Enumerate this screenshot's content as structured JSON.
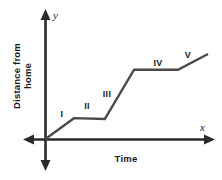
{
  "figure": {
    "background_color": "#ffffff",
    "line_color": "#4a4a4a",
    "axis_color": "#2b2b2b",
    "axis": {
      "x_variable": "x",
      "y_variable": "y",
      "x_title": "Time",
      "y_title_line1": "Distance from",
      "y_title_line2": "home"
    },
    "segment_labels": [
      {
        "id": "I",
        "label": "I"
      },
      {
        "id": "II",
        "label": "II"
      },
      {
        "id": "III",
        "label": "III"
      },
      {
        "id": "IV",
        "label": "IV"
      },
      {
        "id": "V",
        "label": "V"
      }
    ]
  },
  "chart_data": {
    "type": "line",
    "title": "",
    "xlabel": "Time",
    "ylabel": "Distance from home",
    "xlim": [
      0,
      10
    ],
    "ylim": [
      0,
      10
    ],
    "grid": false,
    "legend": "none",
    "axis_ticks": {
      "x": [],
      "y": []
    },
    "annotations": [
      {
        "text": "I",
        "x": 0.6,
        "y": 1.7,
        "note": "first rising segment"
      },
      {
        "text": "II",
        "x": 2.2,
        "y": 2.9,
        "note": "first flat segment"
      },
      {
        "text": "III",
        "x": 3.4,
        "y": 4.5,
        "note": "second rising segment"
      },
      {
        "text": "IV",
        "x": 6.6,
        "y": 7.2,
        "note": "second flat segment"
      },
      {
        "text": "V",
        "x": 8.4,
        "y": 8.0,
        "note": "third rising segment"
      }
    ],
    "series": [
      {
        "name": "distance from home",
        "x": [
          0.0,
          1.75,
          3.65,
          5.45,
          8.15,
          10.0
        ],
        "y": [
          0.0,
          2.45,
          2.35,
          8.15,
          8.15,
          10.0
        ],
        "segments": [
          {
            "label": "I",
            "description": "rising",
            "x_from": 0.0,
            "x_to": 1.75,
            "y_from": 0.0,
            "y_to": 2.45
          },
          {
            "label": "II",
            "description": "flat",
            "x_from": 1.75,
            "x_to": 3.65,
            "y_from": 2.45,
            "y_to": 2.35
          },
          {
            "label": "III",
            "description": "rising",
            "x_from": 3.65,
            "x_to": 5.45,
            "y_from": 2.35,
            "y_to": 8.15
          },
          {
            "label": "IV",
            "description": "flat",
            "x_from": 5.45,
            "x_to": 8.15,
            "y_from": 8.15,
            "y_to": 8.15
          },
          {
            "label": "V",
            "description": "rising",
            "x_from": 8.15,
            "x_to": 10.0,
            "y_from": 8.15,
            "y_to": 10.0
          }
        ]
      }
    ]
  }
}
